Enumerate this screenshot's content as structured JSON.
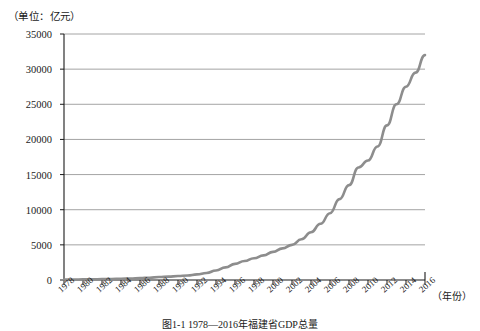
{
  "unit_label": "（单位：亿元）",
  "xaxis_title": "（年份）",
  "caption": "图1-1  1978—2016年福建省GDP总量",
  "colors": {
    "line": "#8d8d8d",
    "axis": "#1a1a1a",
    "grid": "#9a9a9a",
    "background": "#ffffff"
  },
  "chart_data": {
    "type": "line",
    "title": "图1-1  1978—2016年福建省GDP总量",
    "xlabel": "（年份）",
    "ylabel": "（单位：亿元）",
    "xlim": [
      1978,
      2016
    ],
    "ylim": [
      0,
      35000
    ],
    "ytick_step": 5000,
    "xtick_step": 2,
    "grid": true,
    "legend": false,
    "ytick_labels": [
      "0",
      "5000",
      "10000",
      "15000",
      "20000",
      "25000",
      "30000",
      "35000"
    ],
    "ytick_values": [
      0,
      5000,
      10000,
      15000,
      20000,
      25000,
      30000,
      35000
    ],
    "xtick_labels": [
      "1978",
      "1980",
      "1982",
      "1984",
      "1986",
      "1988",
      "1990",
      "1992",
      "1994",
      "1996",
      "1998",
      "2000",
      "2002",
      "2004",
      "2006",
      "2008",
      "2010",
      "2012",
      "2014",
      "2016"
    ],
    "xtick_values": [
      1978,
      1980,
      1982,
      1984,
      1986,
      1988,
      1990,
      1992,
      1994,
      1996,
      1998,
      2000,
      2002,
      2004,
      2006,
      2008,
      2010,
      2012,
      2014,
      2016
    ],
    "series": [
      {
        "name": "GDP总量",
        "color": "#8d8d8d",
        "x": [
          1978,
          1979,
          1980,
          1981,
          1982,
          1983,
          1984,
          1985,
          1986,
          1987,
          1988,
          1989,
          1990,
          1991,
          1992,
          1993,
          1994,
          1995,
          1996,
          1997,
          1998,
          1999,
          2000,
          2001,
          2002,
          2003,
          2004,
          2005,
          2006,
          2007,
          2008,
          2009,
          2010,
          2011,
          2012,
          2013,
          2014,
          2015,
          2016
        ],
        "values": [
          66,
          75,
          87,
          105,
          125,
          145,
          180,
          220,
          270,
          330,
          420,
          480,
          560,
          650,
          800,
          1000,
          1350,
          1800,
          2300,
          2700,
          3100,
          3500,
          4000,
          4500,
          5000,
          5800,
          6800,
          8000,
          9500,
          11500,
          13500,
          16000,
          17000,
          19000,
          22000,
          25000,
          27500,
          29500,
          32000
        ]
      }
    ]
  }
}
